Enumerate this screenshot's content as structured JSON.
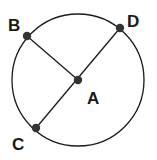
{
  "diagram": {
    "title": "",
    "circle": {
      "cx": 78,
      "cy": 80,
      "r": 66,
      "stroke": "#1a1a1a"
    },
    "points": [
      {
        "name": "A",
        "x": 78,
        "y": 80,
        "label_x": 87,
        "label_y": 104
      },
      {
        "name": "B",
        "x": 27,
        "y": 36,
        "label_x": 8,
        "label_y": 31
      },
      {
        "name": "C",
        "x": 36,
        "y": 128,
        "label_x": 12,
        "label_y": 150
      },
      {
        "name": "D",
        "x": 120,
        "y": 28,
        "label_x": 127,
        "label_y": 27
      }
    ],
    "segments": [
      {
        "from": "B",
        "to": "A"
      },
      {
        "from": "C",
        "to": "D"
      }
    ],
    "point_color": "#333333"
  }
}
